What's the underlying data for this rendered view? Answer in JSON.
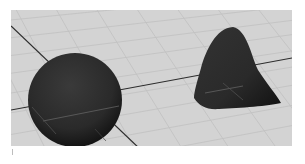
{
  "viewport": {
    "type": "3d-perspective-viewport",
    "background_color": "#d3d3d3",
    "grid_color": "#c2c2c2",
    "axis_color": "#2a2a2a",
    "objects": [
      {
        "name": "sphere",
        "color": "#262626"
      },
      {
        "name": "cone",
        "color": "#262626"
      }
    ]
  }
}
